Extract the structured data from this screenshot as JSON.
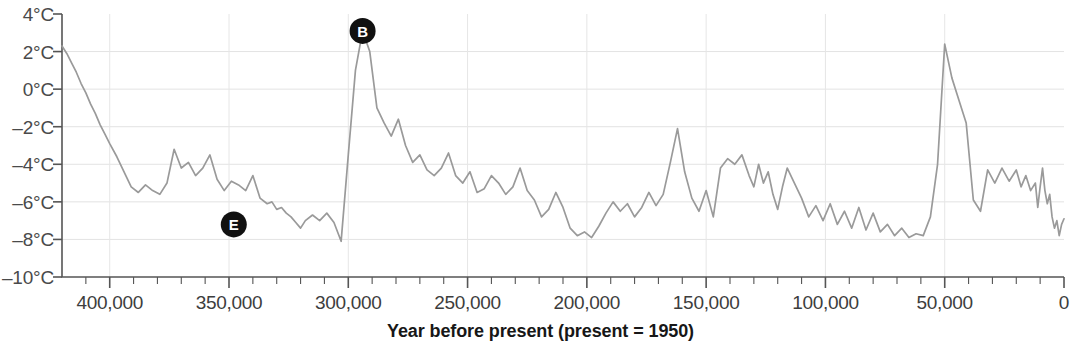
{
  "chart_data": {
    "type": "line",
    "title": "",
    "xlabel": "Year before present (present = 1950)",
    "ylabel": "",
    "xlim": [
      420000,
      0
    ],
    "ylim": [
      -10,
      4
    ],
    "x_reversed": true,
    "grid": true,
    "legend": "none",
    "y_tick_labels": [
      "4°C",
      "2°C",
      "0°C",
      "–2°C",
      "–4°C",
      "–6°C",
      "–8°C",
      "–10°C"
    ],
    "y_tick_values": [
      4,
      2,
      0,
      -2,
      -4,
      -6,
      -8,
      -10
    ],
    "x_tick_labels": [
      "400,000",
      "350,000",
      "300,000",
      "250,000",
      "200,000",
      "150,000",
      "100,000",
      "50,000",
      "0"
    ],
    "x_tick_values": [
      400000,
      350000,
      300000,
      250000,
      200000,
      150000,
      100000,
      50000,
      0
    ],
    "x_minor_tick_step": 10000,
    "series_name": "Temperature anomaly",
    "series_color": "#9a9a9a",
    "units": "°C",
    "x": [
      420000,
      418000,
      416000,
      414000,
      412000,
      410000,
      408000,
      406000,
      404000,
      402000,
      400000,
      397000,
      394000,
      391000,
      388000,
      385000,
      382000,
      379000,
      376000,
      373000,
      370000,
      367000,
      364000,
      361000,
      358000,
      355000,
      352000,
      349000,
      346000,
      343000,
      340000,
      337000,
      334000,
      332000,
      330000,
      328000,
      326000,
      324000,
      322000,
      320000,
      318000,
      315000,
      312000,
      309000,
      306000,
      303000,
      300000,
      297000,
      294000,
      291000,
      288000,
      285000,
      282000,
      279000,
      276000,
      273000,
      270000,
      267000,
      264000,
      261000,
      258000,
      255000,
      252000,
      249000,
      246000,
      243000,
      240000,
      237000,
      234000,
      231000,
      228000,
      225000,
      222000,
      219000,
      216000,
      213000,
      210000,
      207000,
      204000,
      201000,
      198000,
      195000,
      192000,
      189000,
      186000,
      183000,
      180000,
      177000,
      174000,
      171000,
      168000,
      165000,
      162000,
      159000,
      156000,
      153000,
      150000,
      147000,
      144000,
      141000,
      138000,
      135000,
      132000,
      130000,
      128000,
      126000,
      124000,
      122000,
      120000,
      118000,
      116000,
      113000,
      110000,
      107000,
      104000,
      101000,
      98000,
      95000,
      92000,
      89000,
      86000,
      83000,
      80000,
      77000,
      74000,
      71000,
      68000,
      65000,
      62000,
      59000,
      56000,
      53000,
      50000,
      47000,
      44000,
      41000,
      38000,
      35000,
      32000,
      29000,
      26000,
      23000,
      20000,
      18000,
      16000,
      14000,
      12000,
      11000,
      10000,
      9000,
      8000,
      7000,
      6000,
      5000,
      4000,
      3000,
      2000,
      1000,
      0
    ],
    "y": [
      2.3,
      1.9,
      1.4,
      0.9,
      0.3,
      -0.2,
      -0.8,
      -1.3,
      -1.9,
      -2.4,
      -2.9,
      -3.6,
      -4.4,
      -5.2,
      -5.5,
      -5.1,
      -5.4,
      -5.6,
      -5.0,
      -3.2,
      -4.2,
      -3.9,
      -4.6,
      -4.2,
      -3.5,
      -4.8,
      -5.4,
      -4.9,
      -5.1,
      -5.4,
      -4.6,
      -5.8,
      -6.1,
      -6.0,
      -6.4,
      -6.3,
      -6.6,
      -6.8,
      -7.1,
      -7.4,
      -7.0,
      -6.7,
      -7.0,
      -6.6,
      -7.1,
      -8.1,
      -3.5,
      1.0,
      3.1,
      2.0,
      -1.0,
      -1.8,
      -2.5,
      -1.6,
      -3.0,
      -3.9,
      -3.5,
      -4.3,
      -4.6,
      -4.2,
      -3.4,
      -4.6,
      -5.0,
      -4.4,
      -5.5,
      -5.3,
      -4.6,
      -5.0,
      -5.6,
      -5.2,
      -4.2,
      -5.4,
      -5.9,
      -6.8,
      -6.4,
      -5.5,
      -6.3,
      -7.4,
      -7.8,
      -7.6,
      -7.9,
      -7.3,
      -6.6,
      -6.0,
      -6.5,
      -6.1,
      -6.8,
      -6.3,
      -5.5,
      -6.2,
      -5.6,
      -3.9,
      -2.1,
      -4.4,
      -5.8,
      -6.5,
      -5.4,
      -6.8,
      -4.2,
      -3.7,
      -4.0,
      -3.5,
      -4.6,
      -5.2,
      -4.0,
      -5.0,
      -4.4,
      -5.6,
      -6.4,
      -5.2,
      -4.2,
      -5.0,
      -5.8,
      -6.8,
      -6.2,
      -7.0,
      -6.1,
      -7.2,
      -6.5,
      -7.4,
      -6.3,
      -7.5,
      -6.6,
      -7.6,
      -7.2,
      -7.8,
      -7.4,
      -7.9,
      -7.7,
      -7.8,
      -6.8,
      -4.0,
      2.4,
      0.6,
      -0.6,
      -1.8,
      -5.9,
      -6.5,
      -4.3,
      -5.0,
      -4.2,
      -4.9,
      -4.3,
      -5.2,
      -4.6,
      -5.4,
      -5.0,
      -6.3,
      -5.2,
      -4.2,
      -5.4,
      -6.1,
      -5.6,
      -6.8,
      -7.4,
      -7.0,
      -7.8,
      -7.2,
      -6.9,
      -7.5,
      -7.0,
      -4.4,
      -3.5,
      -4.6,
      -1.2,
      0.0,
      -0.5,
      0.3,
      -1.0,
      0.2,
      -1.5,
      -0.3,
      -1.2,
      0.5
    ],
    "annotations": [
      {
        "label": "B",
        "x": 294000,
        "y": 3.1,
        "shape": "filled-circle",
        "color": "#111111",
        "text_color": "#ffffff"
      },
      {
        "label": "E",
        "x": 348000,
        "y": -7.2,
        "shape": "filled-circle",
        "color": "#111111",
        "text_color": "#ffffff"
      }
    ]
  },
  "axis": {
    "x_title": "Year before present (present = 1950)"
  }
}
